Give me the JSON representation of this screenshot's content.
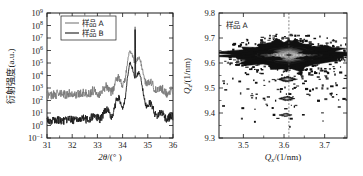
{
  "figure": {
    "background": "#ffffff",
    "ink": "#1a1a1a"
  },
  "chart_data": [
    {
      "type": "line",
      "panel": "left",
      "title": "",
      "xlabel": "2θ/(°)",
      "ylabel": "衍射强度(a.u.)",
      "ylabel_parts": {
        "cjk": "衍射强度",
        "unit": "(a.u.)"
      },
      "xlabel_parts": {
        "sym": "2θ",
        "unit": "/(° )"
      },
      "xlim": [
        31,
        36
      ],
      "ylim_log10": [
        -1,
        9
      ],
      "yscale": "log",
      "xticks": [
        31,
        32,
        33,
        34,
        35,
        36
      ],
      "xticklabels": [
        "31",
        "32",
        "33",
        "34",
        "35",
        "36"
      ],
      "yticks_exp": [
        -1,
        0,
        1,
        2,
        3,
        4,
        5,
        6,
        7,
        8,
        9
      ],
      "yticklabels": [
        "10⁻¹",
        "10⁰",
        "10¹",
        "10²",
        "10³",
        "10⁴",
        "10⁵",
        "10⁶",
        "10⁷",
        "10⁸",
        "10⁹"
      ],
      "grid": false,
      "legend_position": "top-center",
      "peak_position": 34.5,
      "series": [
        {
          "name": "样品 A",
          "color": "#7a7a7a",
          "linewidth": 0.9,
          "baseline_log10": 2.45,
          "peak_log10": 8.7,
          "note": "upper curve, offset for clarity"
        },
        {
          "name": "样品 B",
          "color": "#1a1a1a",
          "linewidth": 0.9,
          "baseline_log10": 0.35,
          "peak_log10": 8.7,
          "note": "lower curve"
        }
      ]
    },
    {
      "type": "heatmap",
      "panel": "right",
      "title": "",
      "annotation": "样品 A",
      "xlabel": "Qx/(1/nm)",
      "ylabel": "Qz/(1/nm)",
      "xlabel_parts": {
        "sym": "Q",
        "sub": "x",
        "unit": "/(1/nm)"
      },
      "ylabel_parts": {
        "sym": "Q",
        "sub": "z",
        "unit": "/(1/nm)"
      },
      "xlim": [
        3.44,
        3.755
      ],
      "ylim": [
        9.3,
        9.8
      ],
      "xticks": [
        3.5,
        3.6,
        3.7
      ],
      "xticklabels": [
        "3.5",
        "3.6",
        "3.7"
      ],
      "yticks": [
        9.3,
        9.4,
        9.5,
        9.6,
        9.7,
        9.8
      ],
      "yticklabels": [
        "9.3",
        "9.4",
        "9.5",
        "9.6",
        "9.7",
        "9.8"
      ],
      "grid": false,
      "reference_line_x": 3.612,
      "main_peak": {
        "x": 3.612,
        "y": 9.632
      },
      "satellites": [
        {
          "x": 3.608,
          "y": 9.535
        },
        {
          "x": 3.607,
          "y": 9.458
        },
        {
          "x": 3.604,
          "y": 9.392
        }
      ],
      "contour_levels": [
        "#101010",
        "#3a3a3a",
        "#6e6e6e",
        "#9a9a9a",
        "#c2c2c2",
        "#e2e2e2",
        "#f2f2f2"
      ]
    }
  ]
}
